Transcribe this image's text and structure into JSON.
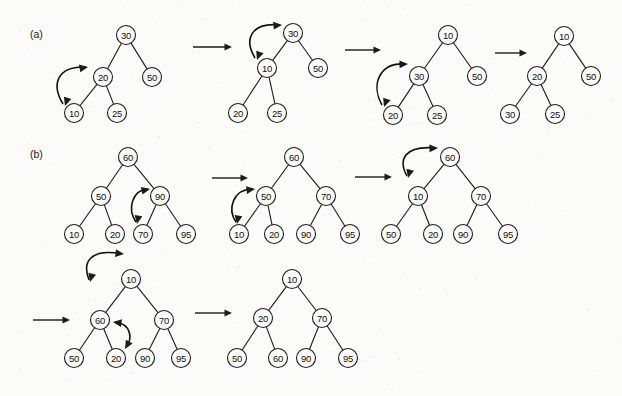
{
  "figure": {
    "background_color": "#fbfbfa",
    "ink_color": "#1b1b1b",
    "node_fill": "#fdfdfc",
    "width": 622,
    "height": 396,
    "node_radius": 9.5
  },
  "part_labels": [
    {
      "name": "part-label-a",
      "text": "(a)",
      "x": 30,
      "y": 38
    },
    {
      "name": "part-label-b",
      "text": "(b)",
      "x": 30,
      "y": 158
    }
  ],
  "step_arrows": [
    {
      "name": "step-arrow-a-1",
      "x1": 193,
      "y1": 47,
      "x2": 232,
      "y2": 47
    },
    {
      "name": "step-arrow-a-2",
      "x1": 345,
      "y1": 50,
      "x2": 381,
      "y2": 50
    },
    {
      "name": "step-arrow-a-3",
      "x1": 495,
      "y1": 53,
      "x2": 527,
      "y2": 53
    },
    {
      "name": "step-arrow-b-1",
      "x1": 212,
      "y1": 178,
      "x2": 248,
      "y2": 178
    },
    {
      "name": "step-arrow-b-2",
      "x1": 355,
      "y1": 177,
      "x2": 392,
      "y2": 177
    },
    {
      "name": "step-arrow-b-3",
      "x1": 33,
      "y1": 320,
      "x2": 70,
      "y2": 320
    },
    {
      "name": "step-arrow-b-4",
      "x1": 195,
      "y1": 313,
      "x2": 232,
      "y2": 313
    }
  ],
  "trees": [
    {
      "name": "tree-a-1",
      "nodes": [
        {
          "id": "a1-30",
          "value": "30",
          "x": 126,
          "y": 35
        },
        {
          "id": "a1-20",
          "value": "20",
          "x": 103,
          "y": 77
        },
        {
          "id": "a1-50",
          "value": "50",
          "x": 152,
          "y": 77
        },
        {
          "id": "a1-10",
          "value": "10",
          "x": 74,
          "y": 113
        },
        {
          "id": "a1-25",
          "value": "25",
          "x": 117,
          "y": 113
        }
      ],
      "edges": [
        [
          "a1-30",
          "a1-20"
        ],
        [
          "a1-30",
          "a1-50"
        ],
        [
          "a1-20",
          "a1-10"
        ],
        [
          "a1-20",
          "a1-25"
        ]
      ],
      "swap": {
        "name": "swap-arrow-a-1",
        "path": "M 63 104 C 52 86 55 66 86 67",
        "head_start": {
          "x": 65,
          "y": 106,
          "angle": 108
        },
        "head_end": {
          "x": 88,
          "y": 67,
          "angle": -10
        }
      }
    },
    {
      "name": "tree-a-2",
      "nodes": [
        {
          "id": "a2-30",
          "value": "30",
          "x": 293,
          "y": 33
        },
        {
          "id": "a2-10",
          "value": "10",
          "x": 267,
          "y": 68
        },
        {
          "id": "a2-50",
          "value": "50",
          "x": 318,
          "y": 68
        },
        {
          "id": "a2-20",
          "value": "20",
          "x": 238,
          "y": 113
        },
        {
          "id": "a2-25",
          "value": "25",
          "x": 277,
          "y": 113
        }
      ],
      "edges": [
        [
          "a2-30",
          "a2-10"
        ],
        [
          "a2-30",
          "a2-50"
        ],
        [
          "a2-10",
          "a2-20"
        ],
        [
          "a2-10",
          "a2-25"
        ]
      ],
      "swap": {
        "name": "swap-arrow-a-2",
        "path": "M 255 58 C 244 40 250 22 280 25",
        "head_start": {
          "x": 257,
          "y": 60,
          "angle": 110
        },
        "head_end": {
          "x": 282,
          "y": 25,
          "angle": -4
        }
      }
    },
    {
      "name": "tree-a-3",
      "nodes": [
        {
          "id": "a3-10",
          "value": "10",
          "x": 448,
          "y": 35
        },
        {
          "id": "a3-30",
          "value": "30",
          "x": 419,
          "y": 76
        },
        {
          "id": "a3-50",
          "value": "50",
          "x": 477,
          "y": 76
        },
        {
          "id": "a3-20",
          "value": "20",
          "x": 393,
          "y": 115
        },
        {
          "id": "a3-25",
          "value": "25",
          "x": 437,
          "y": 115
        }
      ],
      "edges": [
        [
          "a3-10",
          "a3-30"
        ],
        [
          "a3-10",
          "a3-50"
        ],
        [
          "a3-30",
          "a3-20"
        ],
        [
          "a3-30",
          "a3-25"
        ]
      ],
      "swap": {
        "name": "swap-arrow-a-3",
        "path": "M 382 105 C 371 86 378 62 406 64",
        "head_start": {
          "x": 384,
          "y": 107,
          "angle": 110
        },
        "head_end": {
          "x": 408,
          "y": 64,
          "angle": -2
        }
      }
    },
    {
      "name": "tree-a-4",
      "nodes": [
        {
          "id": "a4-10",
          "value": "10",
          "x": 564,
          "y": 36
        },
        {
          "id": "a4-20",
          "value": "20",
          "x": 537,
          "y": 76
        },
        {
          "id": "a4-50",
          "value": "50",
          "x": 591,
          "y": 76
        },
        {
          "id": "a4-30",
          "value": "30",
          "x": 510,
          "y": 114
        },
        {
          "id": "a4-25",
          "value": "25",
          "x": 555,
          "y": 114
        }
      ],
      "edges": [
        [
          "a4-10",
          "a4-20"
        ],
        [
          "a4-10",
          "a4-50"
        ],
        [
          "a4-20",
          "a4-30"
        ],
        [
          "a4-20",
          "a4-25"
        ]
      ],
      "swap": null
    },
    {
      "name": "tree-b-1",
      "nodes": [
        {
          "id": "b1-60",
          "value": "60",
          "x": 128,
          "y": 157
        },
        {
          "id": "b1-50",
          "value": "50",
          "x": 101,
          "y": 196
        },
        {
          "id": "b1-90",
          "value": "90",
          "x": 160,
          "y": 196
        },
        {
          "id": "b1-10",
          "value": "10",
          "x": 74,
          "y": 234
        },
        {
          "id": "b1-20",
          "value": "20",
          "x": 115,
          "y": 234
        },
        {
          "id": "b1-70",
          "value": "70",
          "x": 143,
          "y": 234
        },
        {
          "id": "b1-95",
          "value": "95",
          "x": 186,
          "y": 234
        }
      ],
      "edges": [
        [
          "b1-60",
          "b1-50"
        ],
        [
          "b1-60",
          "b1-90"
        ],
        [
          "b1-50",
          "b1-10"
        ],
        [
          "b1-50",
          "b1-20"
        ],
        [
          "b1-90",
          "b1-70"
        ],
        [
          "b1-90",
          "b1-95"
        ]
      ],
      "swap": {
        "name": "swap-arrow-b-1",
        "path": "M 136 222 C 127 209 132 190 148 189",
        "head_start": {
          "x": 137,
          "y": 224,
          "angle": 100
        },
        "head_end": {
          "x": 150,
          "y": 189,
          "angle": -12
        }
      }
    },
    {
      "name": "tree-b-2",
      "nodes": [
        {
          "id": "b2-60",
          "value": "60",
          "x": 294,
          "y": 157
        },
        {
          "id": "b2-50",
          "value": "50",
          "x": 266,
          "y": 196
        },
        {
          "id": "b2-70",
          "value": "70",
          "x": 326,
          "y": 196
        },
        {
          "id": "b2-10",
          "value": "10",
          "x": 239,
          "y": 234
        },
        {
          "id": "b2-20",
          "value": "20",
          "x": 274,
          "y": 234
        },
        {
          "id": "b2-90",
          "value": "90",
          "x": 306,
          "y": 234
        },
        {
          "id": "b2-95",
          "value": "95",
          "x": 350,
          "y": 234
        }
      ],
      "edges": [
        [
          "b2-60",
          "b2-50"
        ],
        [
          "b2-60",
          "b2-70"
        ],
        [
          "b2-50",
          "b2-10"
        ],
        [
          "b2-50",
          "b2-20"
        ],
        [
          "b2-70",
          "b2-90"
        ],
        [
          "b2-70",
          "b2-95"
        ]
      ],
      "swap": {
        "name": "swap-arrow-b-2",
        "path": "M 236 222 C 227 209 233 189 253 189",
        "head_start": {
          "x": 237,
          "y": 224,
          "angle": 100
        },
        "head_end": {
          "x": 255,
          "y": 189,
          "angle": -8
        }
      }
    },
    {
      "name": "tree-b-3",
      "nodes": [
        {
          "id": "b3-60",
          "value": "60",
          "x": 450,
          "y": 157
        },
        {
          "id": "b3-10",
          "value": "10",
          "x": 418,
          "y": 196
        },
        {
          "id": "b3-70",
          "value": "70",
          "x": 481,
          "y": 196
        },
        {
          "id": "b3-50",
          "value": "50",
          "x": 391,
          "y": 234
        },
        {
          "id": "b3-20",
          "value": "20",
          "x": 433,
          "y": 234
        },
        {
          "id": "b3-90",
          "value": "90",
          "x": 463,
          "y": 234
        },
        {
          "id": "b3-95",
          "value": "95",
          "x": 508,
          "y": 234
        }
      ],
      "edges": [
        [
          "b3-60",
          "b3-10"
        ],
        [
          "b3-60",
          "b3-70"
        ],
        [
          "b3-10",
          "b3-50"
        ],
        [
          "b3-10",
          "b3-20"
        ],
        [
          "b3-70",
          "b3-90"
        ],
        [
          "b3-70",
          "b3-95"
        ]
      ],
      "swap": {
        "name": "swap-arrow-b-3",
        "path": "M 407 176 C 398 160 404 145 436 148",
        "head_start": {
          "x": 408,
          "y": 178,
          "angle": 105
        },
        "head_end": {
          "x": 438,
          "y": 148,
          "angle": -2
        }
      }
    },
    {
      "name": "tree-b-4",
      "nodes": [
        {
          "id": "b4-10",
          "value": "10",
          "x": 131,
          "y": 279
        },
        {
          "id": "b4-60",
          "value": "60",
          "x": 100,
          "y": 320
        },
        {
          "id": "b4-70",
          "value": "70",
          "x": 164,
          "y": 320
        },
        {
          "id": "b4-50",
          "value": "50",
          "x": 74,
          "y": 358
        },
        {
          "id": "b4-20",
          "value": "20",
          "x": 116,
          "y": 358
        },
        {
          "id": "b4-90",
          "value": "90",
          "x": 145,
          "y": 358
        },
        {
          "id": "b4-95",
          "value": "95",
          "x": 181,
          "y": 358
        }
      ],
      "edges": [
        [
          "b4-10",
          "b4-60"
        ],
        [
          "b4-10",
          "b4-70"
        ],
        [
          "b4-60",
          "b4-50"
        ],
        [
          "b4-60",
          "b4-20"
        ],
        [
          "b4-70",
          "b4-90"
        ],
        [
          "b4-70",
          "b4-95"
        ]
      ],
      "swap": {
        "name": "swap-arrow-b-4-top",
        "path": "M 89 280 C 82 262 90 248 122 254",
        "head_start": {
          "x": 90,
          "y": 282,
          "angle": 105
        },
        "head_end": {
          "x": 124,
          "y": 254,
          "angle": 6
        }
      },
      "swap2": {
        "name": "swap-arrow-b-4-lower",
        "path": "M 126 347 C 133 338 131 324 115 322",
        "head_start": {
          "x": 125,
          "y": 349,
          "angle": 120
        },
        "head_end": {
          "x": 113,
          "y": 322,
          "angle": 188
        }
      }
    },
    {
      "name": "tree-b-5",
      "nodes": [
        {
          "id": "b5-10",
          "value": "10",
          "x": 292,
          "y": 279
        },
        {
          "id": "b5-20",
          "value": "20",
          "x": 263,
          "y": 318
        },
        {
          "id": "b5-70",
          "value": "70",
          "x": 322,
          "y": 318
        },
        {
          "id": "b5-50",
          "value": "50",
          "x": 237,
          "y": 358
        },
        {
          "id": "b5-60",
          "value": "60",
          "x": 278,
          "y": 358
        },
        {
          "id": "b5-90",
          "value": "90",
          "x": 306,
          "y": 358
        },
        {
          "id": "b5-95",
          "value": "95",
          "x": 348,
          "y": 358
        }
      ],
      "edges": [
        [
          "b5-10",
          "b5-20"
        ],
        [
          "b5-10",
          "b5-70"
        ],
        [
          "b5-20",
          "b5-50"
        ],
        [
          "b5-20",
          "b5-60"
        ],
        [
          "b5-70",
          "b5-90"
        ],
        [
          "b5-70",
          "b5-95"
        ]
      ],
      "swap": null
    }
  ]
}
